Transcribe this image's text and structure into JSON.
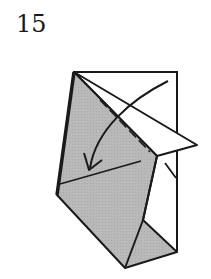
{
  "step": {
    "number": "15"
  },
  "diagram": {
    "colors": {
      "paper_front": "#ffffff",
      "paper_back_shaded": "#b4b4b4",
      "outline": "#1a1a1a"
    },
    "icons": [
      "fold-arrow-icon",
      "valley-fold-line"
    ]
  }
}
